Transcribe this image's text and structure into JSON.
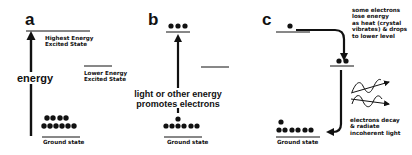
{
  "panels": [
    {
      "letter": "a",
      "levels": [
        {
          "label_line1": "Highest Energy",
          "label_line2": "Excited State"
        },
        {
          "label_line1": "Lower Energy",
          "label_line2": "Excited State"
        },
        {
          "label": "Ground state"
        }
      ],
      "arrow_label": "energy",
      "ground_electrons": {
        "top_row": 4,
        "bottom_row": 6
      }
    },
    {
      "letter": "b",
      "excited_electrons": 3,
      "arrow_label_line1": "light or other energy",
      "arrow_label_line2": "promotes electrons",
      "ground_label": "Ground state",
      "ground_electrons": {
        "top_row": 1,
        "bottom_row": 6
      }
    },
    {
      "letter": "c",
      "top_electrons": 1,
      "middle_electrons": 2,
      "annotation_top": [
        "some electrons",
        "lose energy",
        "as heat (crystal",
        "vibrates) & drops",
        "to lower level"
      ],
      "annotation_bottom": [
        "electrons decay",
        "& radiate",
        "incoherent light"
      ],
      "ground_label": "Ground state",
      "ground_electrons": {
        "top_row": 1,
        "bottom_row": 6
      }
    }
  ],
  "colors": {
    "ink": "#111111",
    "background": "#ffffff"
  }
}
